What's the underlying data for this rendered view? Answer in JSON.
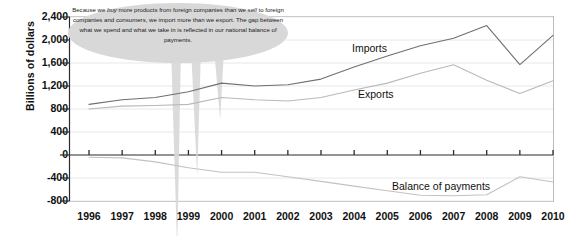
{
  "chart_data": {
    "type": "line",
    "title": "",
    "xlabel": "",
    "ylabel": "Billions of dollars",
    "x": [
      1996,
      1997,
      1998,
      1999,
      2000,
      2001,
      2002,
      2003,
      2004,
      2005,
      2006,
      2007,
      2008,
      2009,
      2010
    ],
    "categories": [
      "1996",
      "1997",
      "1998",
      "1999",
      "2000",
      "2001",
      "2002",
      "2003",
      "2004",
      "2005",
      "2006",
      "2007",
      "2008",
      "2009",
      "2010"
    ],
    "ylim": [
      -800,
      2400
    ],
    "yticks": [
      2400,
      2000,
      1600,
      1200,
      800,
      400,
      0,
      -400,
      -800
    ],
    "ytick_labels": [
      "2,400",
      "2,000",
      "1,600",
      "1,200",
      "800",
      "400",
      "0",
      "-400",
      "-800"
    ],
    "grid": true,
    "legend": "inline-labels",
    "series": [
      {
        "name": "Imports",
        "label": "Imports",
        "color": "#6f6f6f",
        "values": [
          880,
          960,
          1000,
          1100,
          1250,
          1200,
          1220,
          1320,
          1530,
          1720,
          1900,
          2030,
          2250,
          1570,
          2080
        ]
      },
      {
        "name": "Exports",
        "label": "Exports",
        "color": "#b9b9b9",
        "values": [
          800,
          850,
          860,
          880,
          1000,
          960,
          940,
          1000,
          1130,
          1250,
          1420,
          1570,
          1300,
          1070,
          1290
        ]
      },
      {
        "name": "Balance of payments",
        "label": "Balance of payments",
        "color": "#c2c2c2",
        "values": [
          -40,
          -50,
          -120,
          -220,
          -300,
          -300,
          -380,
          -460,
          -540,
          -620,
          -700,
          -710,
          -690,
          -380,
          -470
        ]
      }
    ]
  },
  "callout": {
    "line1_a": "Because we ",
    "line1_em": "buy",
    "line1_b": " more products from foreign companies than",
    "line2_a": "we ",
    "line2_em": "sell",
    "line2_b": " to foreign companies and consumers, we import more than we export.",
    "line3": "The gap between what we spend and what we take in is reflected in our",
    "line4": "national balance of payments."
  },
  "colors": {
    "axis": "#2b2b2b",
    "grid": "#e2e2e2",
    "callout_fill": "#d8d8d8",
    "imports": "#6f6f6f",
    "exports": "#b9b9b9",
    "balance": "#c2c2c2",
    "plot_border": "#b5b5b5"
  }
}
